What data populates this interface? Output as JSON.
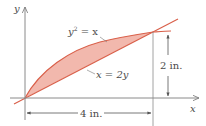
{
  "diagram": {
    "axes": {
      "x_label": "x",
      "y_label": "y"
    },
    "curves": [
      {
        "name": "parabola",
        "equation": "y² = x",
        "label_main": "y",
        "label_sup": "2",
        "label_rest": " = x"
      },
      {
        "name": "line",
        "equation": "x = 2y",
        "label": "x = 2y"
      }
    ],
    "dimensions": {
      "horizontal": "4 in.",
      "vertical": "2 in."
    },
    "colors": {
      "fill": "#f2b8ad",
      "curve": "#d9604a",
      "axis": "#7a7a7a",
      "text": "#4a4a4a"
    }
  }
}
